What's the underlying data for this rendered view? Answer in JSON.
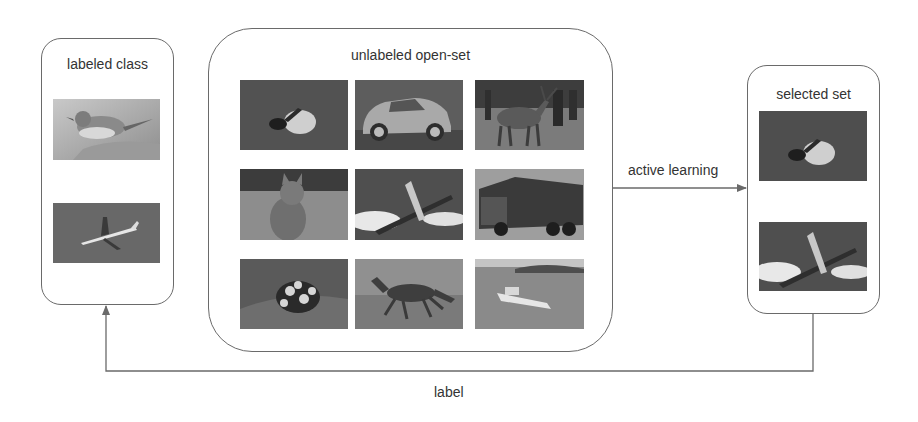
{
  "diagram": {
    "labeled_box": {
      "title": "labeled class",
      "images": [
        {
          "subject": "bird",
          "tone": "light-gray"
        },
        {
          "subject": "airplane",
          "tone": "dark-gray"
        }
      ]
    },
    "unlabeled_box": {
      "title": "unlabeled open-set",
      "images": [
        {
          "subject": "bird-in-water"
        },
        {
          "subject": "car"
        },
        {
          "subject": "deer"
        },
        {
          "subject": "cat"
        },
        {
          "subject": "airplane"
        },
        {
          "subject": "truck"
        },
        {
          "subject": "frog"
        },
        {
          "subject": "horse"
        },
        {
          "subject": "ship"
        }
      ]
    },
    "selected_box": {
      "title": "selected set",
      "images": [
        {
          "subject": "bird-in-water"
        },
        {
          "subject": "airplane"
        }
      ]
    },
    "edges": {
      "active_learning": {
        "label": "active learning",
        "from": "unlabeled open-set",
        "to": "selected set"
      },
      "label": {
        "label": "label",
        "from": "selected set",
        "to": "labeled class"
      }
    },
    "colors": {
      "stroke": "#6a6a6a",
      "text": "#333333",
      "background": "#ffffff"
    }
  }
}
